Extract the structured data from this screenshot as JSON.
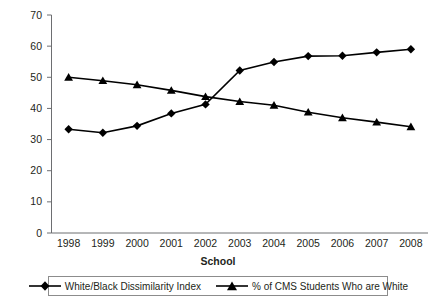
{
  "chart_data": {
    "type": "line",
    "title": "",
    "xlabel": "School",
    "ylabel": "",
    "categories": [
      "1998",
      "1999",
      "2000",
      "2001",
      "2002",
      "2003",
      "2004",
      "2005",
      "2006",
      "2007",
      "2008"
    ],
    "x": [
      1998,
      1999,
      2000,
      2001,
      2002,
      2003,
      2004,
      2005,
      2006,
      2007,
      2008
    ],
    "ylim": [
      0,
      70
    ],
    "yticks": [
      0,
      10,
      20,
      30,
      40,
      50,
      60,
      70
    ],
    "grid": false,
    "legend_position": "bottom",
    "series": [
      {
        "name": "White/Black Dissimilarity Index",
        "marker": "diamond",
        "color": "#000000",
        "values": [
          33.3,
          32.2,
          34.4,
          38.4,
          41.3,
          52.2,
          54.9,
          56.8,
          56.9,
          58.0,
          59.0
        ]
      },
      {
        "name": "% of CMS Students Who are White",
        "marker": "triangle",
        "color": "#000000",
        "values": [
          50.0,
          48.9,
          47.6,
          45.8,
          43.8,
          42.2,
          41.0,
          38.8,
          37.0,
          35.6,
          34.1
        ]
      }
    ]
  },
  "axis": {
    "x_title": "School",
    "y_tick_labels": [
      "70",
      "60",
      "50",
      "40",
      "30",
      "20",
      "10",
      "0"
    ],
    "x_tick_labels": [
      "1998",
      "1999",
      "2000",
      "2001",
      "2002",
      "2003",
      "2004",
      "2005",
      "2006",
      "2007",
      "2008"
    ]
  },
  "legend": {
    "entries": [
      {
        "label": "White/Black Dissimilarity Index",
        "marker": "diamond"
      },
      {
        "label": "% of CMS Students Who are White",
        "marker": "triangle"
      }
    ]
  },
  "colors": {
    "series_line": "#000000",
    "axis": "#231f20",
    "legend_border": "#8c8c8c",
    "background": "#ffffff"
  }
}
